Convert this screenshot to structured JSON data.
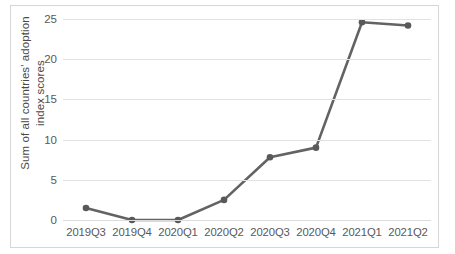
{
  "chart_data": {
    "type": "line",
    "title": "",
    "xlabel": "",
    "ylabel": "Sum of all countries' adoption\nindex scores",
    "categories": [
      "2019Q3",
      "2019Q4",
      "2020Q1",
      "2020Q2",
      "2020Q3",
      "2020Q4",
      "2021Q1",
      "2021Q2"
    ],
    "values": [
      1.5,
      0.0,
      0.0,
      2.5,
      7.8,
      9.0,
      24.6,
      24.2
    ],
    "series": [
      {
        "name": "Sum of all countries' adoption index scores",
        "values": [
          1.5,
          0.0,
          0.0,
          2.5,
          7.8,
          9.0,
          24.6,
          24.2
        ]
      }
    ],
    "ylim": [
      0,
      25
    ],
    "yticks": [
      0,
      5,
      10,
      15,
      20,
      25
    ],
    "ytick_labels": [
      "0",
      "5",
      "10",
      "15",
      "20",
      "25"
    ],
    "grid": true,
    "grid_axis": "y",
    "legend": false,
    "legend_position": "none",
    "markers": true,
    "colors": {
      "line": "#636363",
      "marker": "#595959",
      "gridline": "#e2e2e2",
      "border": "#d6d6d6",
      "text": "#595959",
      "background": "#ffffff"
    }
  }
}
